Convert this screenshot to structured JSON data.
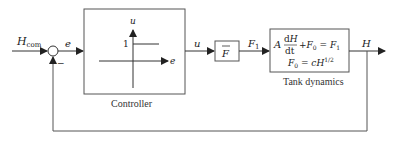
{
  "diagram": {
    "type": "block-diagram",
    "input": {
      "label": "H",
      "subscript": "com"
    },
    "summing_junction": {
      "signs": [
        "+",
        "−"
      ],
      "minus_label": "−"
    },
    "signals": {
      "error": "e",
      "control": "u",
      "flow_in": "F",
      "flow_in_sub": "1",
      "output": "H"
    },
    "controller": {
      "caption": "Controller",
      "plot": {
        "y_axis": "u",
        "x_axis": "e",
        "level_label": "1"
      }
    },
    "gain_block": {
      "label": "F",
      "overbar": true
    },
    "tank": {
      "caption": "Tank dynamics",
      "eq1": {
        "A": "A",
        "num": "dH",
        "den": "dt",
        "rest1": "+F",
        "rest1_sub": "0",
        "rest2": " = F",
        "rest2_sub": "1"
      },
      "eq2": {
        "lhs": "F",
        "lhs_sub": "0",
        "rhs": " = cH",
        "rhs_sup": "1/2"
      }
    },
    "colors": {
      "line": "#333333",
      "box": "#555555"
    }
  }
}
